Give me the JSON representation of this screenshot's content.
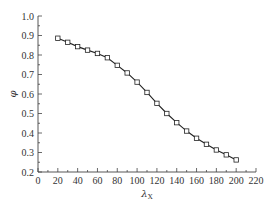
{
  "chart_data": {
    "type": "line",
    "title": "",
    "xlabel": "λX",
    "xlabel_main": "λ",
    "xlabel_sub": "X",
    "ylabel": "φ",
    "xlim": [
      0,
      220
    ],
    "ylim": [
      0.2,
      1.0
    ],
    "xticks": [
      0,
      20,
      40,
      60,
      80,
      100,
      120,
      140,
      160,
      180,
      200,
      220
    ],
    "yticks": [
      0.2,
      0.3,
      0.4,
      0.5,
      0.6,
      0.7,
      0.8,
      0.9,
      1.0
    ],
    "ytick_labels": [
      "0.2",
      "0.3",
      "0.4",
      "0.5",
      "0.6",
      "0.7",
      "0.8",
      "0.9",
      "1.0"
    ],
    "x_minor_step": 10,
    "y_minor_step": 0.05,
    "grid": false,
    "legend": null,
    "series": [
      {
        "name": "φ",
        "marker": "open-square",
        "color": "#222222",
        "x": [
          20,
          30,
          40,
          50,
          60,
          70,
          80,
          90,
          100,
          110,
          120,
          130,
          140,
          150,
          160,
          170,
          180,
          190,
          200
        ],
        "values": [
          0.886,
          0.865,
          0.843,
          0.825,
          0.808,
          0.786,
          0.747,
          0.708,
          0.661,
          0.608,
          0.552,
          0.5,
          0.453,
          0.41,
          0.373,
          0.342,
          0.313,
          0.288,
          0.262
        ]
      }
    ]
  },
  "layout": {
    "plot_left": 38,
    "plot_right": 256,
    "plot_top": 16,
    "plot_bottom": 172,
    "axis_color": "#444444"
  }
}
